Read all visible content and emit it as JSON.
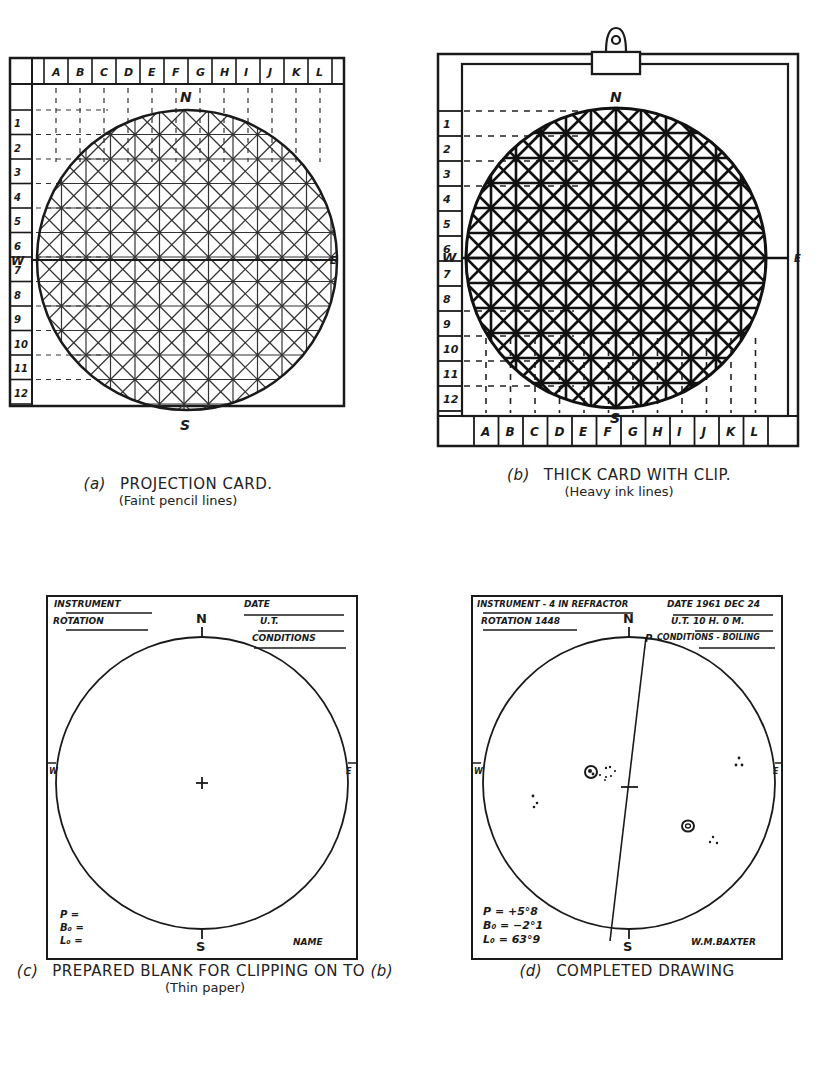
{
  "panels": {
    "a": {
      "tag": "(a)",
      "title": "PROJECTION CARD.",
      "subtitle": "(Faint pencil lines)",
      "columns": [
        "A",
        "B",
        "C",
        "D",
        "E",
        "F",
        "G",
        "H",
        "I",
        "J",
        "K",
        "L"
      ],
      "rows": [
        "1",
        "2",
        "3",
        "4",
        "5",
        "6",
        "7",
        "8",
        "9",
        "10",
        "11",
        "12"
      ],
      "compass": {
        "n": "N",
        "s": "S",
        "e": "E",
        "w": "W"
      }
    },
    "b": {
      "tag": "(b)",
      "title": "THICK CARD WITH CLIP.",
      "subtitle": "(Heavy ink lines)",
      "columns": [
        "A",
        "B",
        "C",
        "D",
        "E",
        "F",
        "G",
        "H",
        "I",
        "J",
        "K",
        "L"
      ],
      "rows": [
        "1",
        "2",
        "3",
        "4",
        "5",
        "6",
        "7",
        "8",
        "9",
        "10",
        "11",
        "12"
      ],
      "compass": {
        "n": "N",
        "s": "S",
        "e": "E",
        "w": "W"
      }
    },
    "c": {
      "tag": "(c)",
      "title": "PREPARED BLANK FOR CLIPPING ON TO",
      "title_ref": "(b)",
      "subtitle": "(Thin paper)",
      "fields": {
        "instrument": "INSTRUMENT",
        "rotation": "ROTATION",
        "date": "DATE",
        "ut": "U.T.",
        "conditions": "CONDITIONS",
        "p": "P =",
        "b0": "B₀ =",
        "l0": "L₀ =",
        "name": "NAME"
      },
      "compass": {
        "n": "N",
        "s": "S",
        "e": "E",
        "w": "W"
      }
    },
    "d": {
      "tag": "(d)",
      "title": "COMPLETED DRAWING",
      "fields": {
        "instrument": "INSTRUMENT - 4 IN REFRACTOR",
        "rotation": "ROTATION 1448",
        "date": "DATE 1961 DEC 24",
        "ut": "U.T. 10 H. 0 M.",
        "conditions": "CONDITIONS - BOILING",
        "p": "P = +5°8",
        "b0": "B₀ = −2°1",
        "l0": "L₀ = 63°9",
        "name": "W.M.BAXTER",
        "axis_label": "P"
      },
      "compass": {
        "n": "N",
        "s": "S",
        "e": "E",
        "w": "W"
      }
    }
  }
}
